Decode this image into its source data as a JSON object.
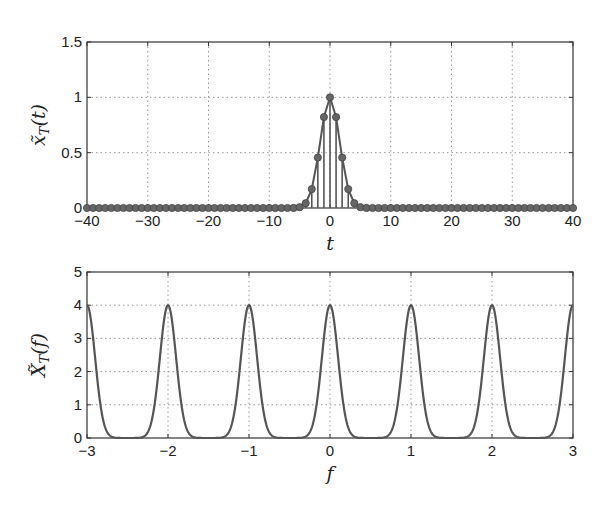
{
  "chart_data": [
    {
      "type": "line",
      "subtype": "stem",
      "title": "",
      "xlabel": "t",
      "ylabel": "x̃_T(t)",
      "xlim": [
        -40,
        40
      ],
      "ylim": [
        0,
        1.5
      ],
      "xticks": [
        -40,
        -30,
        -20,
        -10,
        0,
        10,
        20,
        30,
        40
      ],
      "yticks": [
        0,
        0.5,
        1,
        1.5
      ],
      "xtick_labels": [
        "−40",
        "−30",
        "−20",
        "−10",
        "0",
        "10",
        "20",
        "30",
        "40"
      ],
      "ytick_labels": [
        "0",
        "0.5",
        "1",
        "1.5"
      ],
      "grid": true,
      "series": [
        {
          "name": "samples",
          "x": [
            -40,
            -39,
            -38,
            -37,
            -36,
            -35,
            -34,
            -33,
            -32,
            -31,
            -30,
            -29,
            -28,
            -27,
            -26,
            -25,
            -24,
            -23,
            -22,
            -21,
            -20,
            -19,
            -18,
            -17,
            -16,
            -15,
            -14,
            -13,
            -12,
            -11,
            -10,
            -9,
            -8,
            -7,
            -6,
            -5,
            -4,
            -3,
            -2,
            -1,
            0,
            1,
            2,
            3,
            4,
            5,
            6,
            7,
            8,
            9,
            10,
            11,
            12,
            13,
            14,
            15,
            16,
            17,
            18,
            19,
            20,
            21,
            22,
            23,
            24,
            25,
            26,
            27,
            28,
            29,
            30,
            31,
            32,
            33,
            34,
            35,
            36,
            37,
            38,
            39,
            40
          ],
          "formula": "exp(-pi*t^2/16)",
          "key_values": {
            "0": 1.0,
            "1": 0.82,
            "2": 0.46,
            "3": 0.17,
            "4": 0.04,
            "5": 0.007
          }
        }
      ]
    },
    {
      "type": "line",
      "title": "",
      "xlabel": "f",
      "ylabel": "X̃_T(f)",
      "xlim": [
        -3,
        3
      ],
      "ylim": [
        0,
        5
      ],
      "xticks": [
        -3,
        -2,
        -1,
        0,
        1,
        2,
        3
      ],
      "yticks": [
        0,
        1,
        2,
        3,
        4,
        5
      ],
      "xtick_labels": [
        "−3",
        "−2",
        "−1",
        "0",
        "1",
        "2",
        "3"
      ],
      "ytick_labels": [
        "0",
        "1",
        "2",
        "3",
        "4",
        "5"
      ],
      "grid": true,
      "series": [
        {
          "name": "spectrum",
          "formula": "sum_k 4*exp(-16*pi*(f-k)^2)",
          "peaks_x": [
            -2,
            -1,
            0,
            1,
            2
          ],
          "peak_height": 4
        }
      ]
    }
  ],
  "top_plot": {
    "ylabel_main": "x̃",
    "ylabel_sub": "T",
    "ylabel_arg": "(t)",
    "xlabel": "t"
  },
  "bottom_plot": {
    "ylabel_main": "X̃",
    "ylabel_sub": "T",
    "ylabel_arg": "(f)",
    "xlabel": "f"
  },
  "colors": {
    "line": "#555555",
    "marker": "#666666",
    "axis": "#333333",
    "grid": "#999999"
  }
}
